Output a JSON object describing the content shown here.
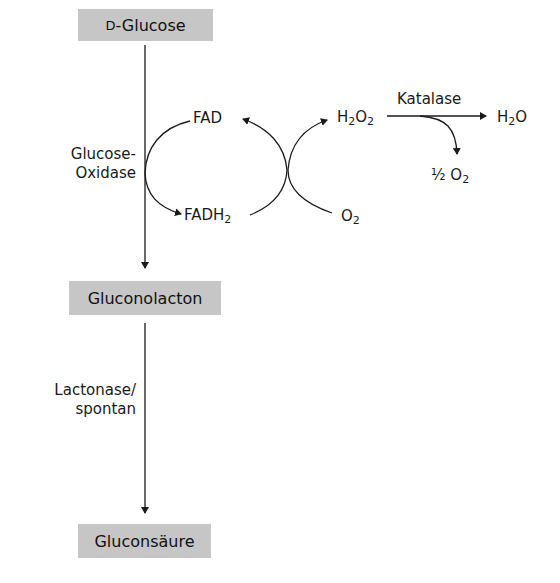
{
  "diagram": {
    "type": "biochemical-reaction-pathway",
    "nodes": {
      "glucose": {
        "prefix": "D",
        "label": "-Glucose"
      },
      "gluconolacton": {
        "label": "Gluconolacton"
      },
      "gluconsaeure": {
        "label": "Gluconsäure"
      }
    },
    "enzymes": {
      "glucose_oxidase_line1": "Glucose-",
      "glucose_oxidase_line2": "Oxidase",
      "lactonase_line1": "Lactonase/",
      "lactonase_line2": "spontan",
      "katalase": "Katalase"
    },
    "cofactors": {
      "fad": "FAD",
      "fadh2_base": "FADH",
      "fadh2_sub": "2"
    },
    "molecules": {
      "h2o2_h": "H",
      "h2o2_sub1": "2",
      "h2o2_o": "O",
      "h2o2_sub2": "2",
      "o2_o": "O",
      "o2_sub": "2",
      "h2o_h": "H",
      "h2o_sub": "2",
      "h2o_o": "O",
      "half_o2_prefix": "½ O",
      "half_o2_sub": "2"
    },
    "edges": [
      {
        "from": "D-Glucose",
        "to": "Gluconolacton",
        "enzyme": "Glucose-Oxidase"
      },
      {
        "from": "Gluconolacton",
        "to": "Gluconsäure",
        "enzyme": "Lactonase/spontan"
      },
      {
        "from": "FAD",
        "to": "FADH2",
        "coupled_to": "Glucose-Oxidase"
      },
      {
        "from": "FADH2",
        "to": "FAD",
        "coupled": "O2 -> H2O2"
      },
      {
        "from": "H2O2",
        "to": "H2O",
        "enzyme": "Katalase",
        "byproduct": "½ O2"
      }
    ],
    "colors": {
      "box_fill": "#c6c6c6",
      "line": "#1a1a1a",
      "background": "#ffffff"
    }
  }
}
